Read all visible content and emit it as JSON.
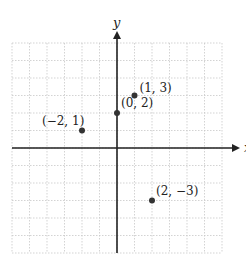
{
  "chart_data": {
    "type": "scatter",
    "title": "",
    "xlabel": "x",
    "ylabel": "y",
    "xlim": [
      -6,
      6
    ],
    "ylim": [
      -6,
      6
    ],
    "grid": true,
    "grid_step": 1,
    "points": [
      {
        "x": -2,
        "y": 1,
        "label": "(−2, 1)"
      },
      {
        "x": 0,
        "y": 2,
        "label": "(0, 2)"
      },
      {
        "x": 1,
        "y": 3,
        "label": "(1, 3)"
      },
      {
        "x": 2,
        "y": -3,
        "label": "(2, −3)"
      }
    ]
  },
  "colors": {
    "axis": "#222222",
    "grid": "#c8c8c8",
    "point": "#333333"
  }
}
